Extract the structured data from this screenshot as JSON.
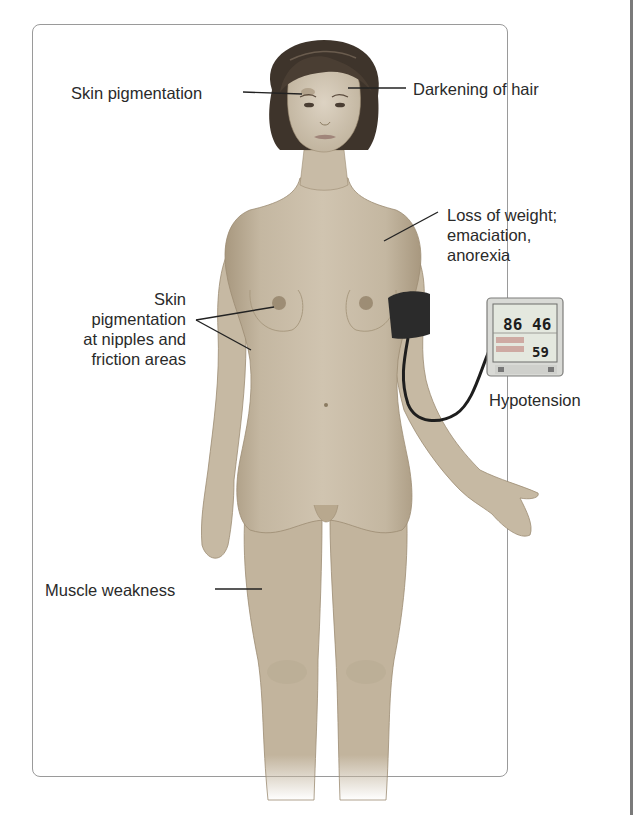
{
  "figure": {
    "type": "medical-illustration"
  },
  "labels": {
    "skin_pigmentation_face": "Skin pigmentation",
    "darkening_of_hair": "Darkening of hair",
    "loss_of_weight": {
      "line1": "Loss of weight;",
      "line2": "emaciation,",
      "line3": "anorexia"
    },
    "skin_pigmentation_nipples": {
      "line1": "Skin",
      "line2": "pigmentation",
      "line3": "at nipples and",
      "line4": "friction areas"
    },
    "hypotension": "Hypotension",
    "muscle_weakness": "Muscle weakness"
  },
  "bp_monitor": {
    "systolic": "86",
    "diastolic": "46",
    "pulse": "59"
  },
  "colors": {
    "skin": "#c9bca7",
    "skin_shadow": "#a8987f",
    "hair": "#3e342b",
    "cuff": "#2b2b2b",
    "monitor_body": "#d9dad6",
    "monitor_screen": "#e4e8df",
    "label_text": "#2a2a2a",
    "panel_border": "#9a9a9a"
  }
}
